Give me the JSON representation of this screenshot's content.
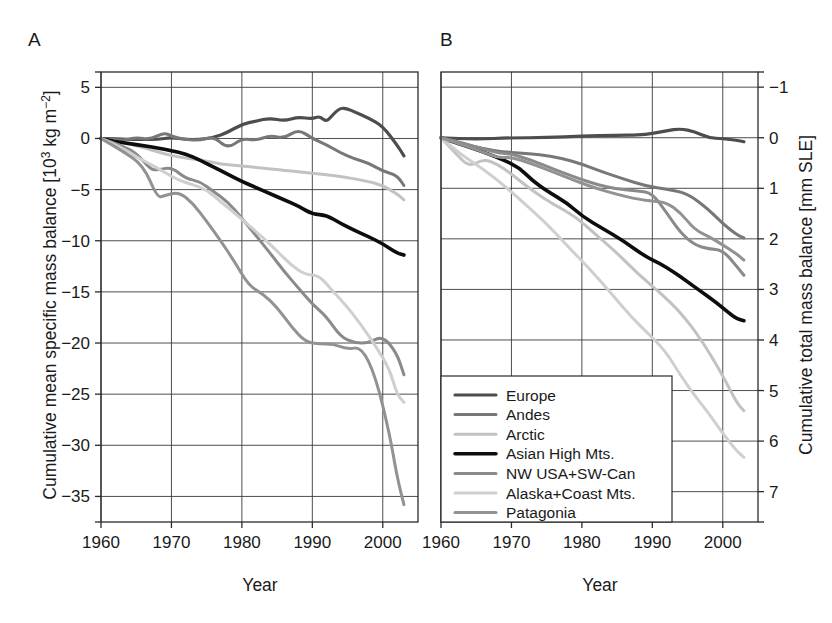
{
  "figure": {
    "panels": [
      {
        "label": "A",
        "xlabel": "Year",
        "ylabel": "Cumulative mean specific mass balance [10³ kg m⁻²]"
      },
      {
        "label": "B",
        "xlabel": "Year",
        "ylabel": "Cumulative total mass balance [mm SLE]"
      }
    ]
  },
  "legend": {
    "entries": [
      {
        "label": "Europe",
        "color": "#4d4d4d"
      },
      {
        "label": "Andes",
        "color": "#777777"
      },
      {
        "label": "Arctic",
        "color": "#c2c2c2"
      },
      {
        "label": "Asian High Mts.",
        "color": "#0d0d0d"
      },
      {
        "label": "NW USA+SW-Can",
        "color": "#8a8a8a"
      },
      {
        "label": "Alaska+Coast Mts.",
        "color": "#cfcfcf"
      },
      {
        "label": "Patagonia",
        "color": "#929292"
      }
    ]
  },
  "chart_data": [
    {
      "type": "line",
      "panel": "A",
      "title": "",
      "xlabel": "Year",
      "ylabel": "Cumulative mean specific mass balance [10³ kg m⁻²]",
      "xlim": [
        1960,
        2005
      ],
      "ylim": [
        -37.5,
        6.5
      ],
      "xticks": [
        1960,
        1970,
        1980,
        1990,
        2000
      ],
      "xticklabels": [
        "1960",
        "1970",
        "1980",
        "1990",
        "2000"
      ],
      "yticks": [
        5,
        0,
        -5,
        -10,
        -15,
        -20,
        -25,
        -30,
        -35
      ],
      "yticklabels": [
        "5",
        "0",
        "−5",
        "−10",
        "−15",
        "−20",
        "−25",
        "−30",
        "−35"
      ],
      "grid": true,
      "legend_position": "outside-bottom-center",
      "series": [
        {
          "name": "Europe",
          "color": "#4d4d4d",
          "x": [
            1960,
            1962,
            1964,
            1966,
            1968,
            1970,
            1972,
            1974,
            1976,
            1978,
            1980,
            1982,
            1984,
            1986,
            1988,
            1990,
            1991,
            1992,
            1993,
            1994,
            1995,
            1996,
            1998,
            2000,
            2002,
            2003
          ],
          "values": [
            0,
            0,
            -0.1,
            -0.1,
            -0.1,
            0.1,
            -0.1,
            -0.1,
            0.1,
            0.6,
            1.4,
            1.7,
            2.0,
            1.7,
            2.1,
            1.9,
            2.2,
            1.6,
            2.4,
            3.0,
            2.9,
            2.6,
            2.0,
            1.2,
            -0.6,
            -1.7
          ]
        },
        {
          "name": "Andes",
          "color": "#777777",
          "x": [
            1960,
            1963,
            1965,
            1967,
            1969,
            1970,
            1972,
            1974,
            1976,
            1978,
            1980,
            1982,
            1984,
            1986,
            1988,
            1990,
            1992,
            1994,
            1996,
            1998,
            2000,
            2002,
            2003
          ],
          "values": [
            0,
            -0.2,
            0.1,
            -0.1,
            0.6,
            0.2,
            -0.1,
            -0.2,
            0.2,
            -1.0,
            0.0,
            -0.2,
            0.3,
            0.0,
            0.9,
            0.0,
            -0.6,
            -1.4,
            -2.0,
            -2.4,
            -3.2,
            -3.6,
            -4.6
          ]
        },
        {
          "name": "Arctic",
          "color": "#c2c2c2",
          "x": [
            1960,
            1963,
            1965,
            1967,
            1969,
            1971,
            1973,
            1975,
            1977,
            1980,
            1983,
            1986,
            1990,
            1994,
            1998,
            2000,
            2002,
            2003
          ],
          "values": [
            0,
            -0.4,
            -0.7,
            -1.1,
            -1.5,
            -1.8,
            -2.0,
            -2.2,
            -2.5,
            -2.7,
            -2.9,
            -3.1,
            -3.4,
            -3.7,
            -4.2,
            -4.6,
            -5.4,
            -6.0
          ]
        },
        {
          "name": "Asian High Mts.",
          "color": "#0d0d0d",
          "x": [
            1960,
            1962,
            1964,
            1966,
            1968,
            1970,
            1972,
            1974,
            1976,
            1978,
            1980,
            1982,
            1984,
            1986,
            1988,
            1990,
            1992,
            1994,
            1996,
            1998,
            2000,
            2002,
            2003
          ],
          "values": [
            0,
            -0.3,
            -0.5,
            -0.7,
            -0.9,
            -1.2,
            -1.5,
            -2.1,
            -2.8,
            -3.5,
            -4.2,
            -4.8,
            -5.4,
            -6.0,
            -6.6,
            -7.4,
            -7.5,
            -8.3,
            -9.0,
            -9.6,
            -10.3,
            -11.2,
            -11.4
          ]
        },
        {
          "name": "NW USA+SW-Can",
          "color": "#8a8a8a",
          "x": [
            1960,
            1963,
            1965,
            1967,
            1968,
            1970,
            1972,
            1974,
            1976,
            1978,
            1980,
            1982,
            1984,
            1986,
            1988,
            1990,
            1992,
            1994,
            1996,
            1998,
            2000,
            2002,
            2003
          ],
          "values": [
            0,
            -0.7,
            -1.4,
            -3.0,
            -3.1,
            -2.8,
            -3.9,
            -4.2,
            -5.2,
            -6.2,
            -7.8,
            -9.5,
            -11.2,
            -13.0,
            -14.6,
            -16.2,
            -17.4,
            -19.4,
            -20.0,
            -20.0,
            -19.3,
            -21.0,
            -23.1
          ]
        },
        {
          "name": "Alaska+Coast Mts.",
          "color": "#cfcfcf",
          "x": [
            1960,
            1963,
            1965,
            1967,
            1969,
            1971,
            1973,
            1975,
            1977,
            1979,
            1981,
            1983,
            1985,
            1987,
            1989,
            1991,
            1993,
            1995,
            1997,
            1999,
            2001,
            2002,
            2003
          ],
          "values": [
            0,
            -0.9,
            -1.8,
            -2.5,
            -3.3,
            -4.1,
            -4.5,
            -5.0,
            -6.2,
            -7.3,
            -8.5,
            -9.7,
            -11.0,
            -12.4,
            -13.3,
            -13.4,
            -15.0,
            -16.5,
            -18.3,
            -20.3,
            -22.6,
            -25.0,
            -25.8
          ]
        },
        {
          "name": "Patagonia",
          "color": "#929292",
          "x": [
            1960,
            1963,
            1966,
            1968,
            1969,
            1971,
            1973,
            1975,
            1977,
            1979,
            1981,
            1983,
            1985,
            1987,
            1989,
            1991,
            1993,
            1995,
            1997,
            1999,
            2001,
            2002,
            2003
          ],
          "values": [
            0,
            -1.2,
            -2.6,
            -5.8,
            -5.6,
            -5.2,
            -6.3,
            -8.1,
            -10.0,
            -12.1,
            -14.4,
            -15.2,
            -16.5,
            -18.4,
            -19.9,
            -20.1,
            -20.1,
            -20.6,
            -20.4,
            -23.3,
            -29.0,
            -33.0,
            -35.8
          ]
        }
      ]
    },
    {
      "type": "line",
      "panel": "B",
      "title": "",
      "xlabel": "Year",
      "ylabel": "Cumulative total mass balance [mm SLE]",
      "xlim": [
        1960,
        2005
      ],
      "ylim": [
        -1.3,
        7.6
      ],
      "xticks": [
        1960,
        1970,
        1980,
        1990,
        2000
      ],
      "xticklabels": [
        "1960",
        "1970",
        "1980",
        "1990",
        "2000"
      ],
      "yticks": [
        -1,
        0,
        1,
        2,
        3,
        4,
        5,
        6,
        7
      ],
      "yticklabels": [
        "−1",
        "0",
        "1",
        "2",
        "3",
        "4",
        "5",
        "6",
        "7"
      ],
      "y_axis_inverted": true,
      "grid": true,
      "legend_position": "inside-bottom-left",
      "series": [
        {
          "name": "Europe",
          "color": "#4d4d4d",
          "x": [
            1960,
            1965,
            1970,
            1975,
            1980,
            1985,
            1988,
            1990,
            1992,
            1994,
            1996,
            1998,
            2000,
            2002,
            2003
          ],
          "values": [
            0,
            0.03,
            0.0,
            0.0,
            -0.03,
            -0.05,
            -0.05,
            -0.08,
            -0.14,
            -0.18,
            -0.12,
            0.0,
            0.02,
            0.05,
            0.08
          ]
        },
        {
          "name": "Andes",
          "color": "#777777",
          "x": [
            1960,
            1963,
            1966,
            1969,
            1971,
            1974,
            1977,
            1980,
            1983,
            1986,
            1989,
            1992,
            1995,
            1998,
            2000,
            2002,
            2003
          ],
          "values": [
            0,
            0.12,
            0.22,
            0.28,
            0.3,
            0.33,
            0.4,
            0.52,
            0.68,
            0.82,
            0.95,
            1.02,
            1.1,
            1.42,
            1.7,
            1.92,
            1.98
          ]
        },
        {
          "name": "Arctic",
          "color": "#c2c2c2",
          "x": [
            1960,
            1962,
            1964,
            1966,
            1968,
            1970,
            1973,
            1976,
            1979,
            1982,
            1985,
            1988,
            1991,
            1994,
            1997,
            2000,
            2002,
            2003
          ],
          "values": [
            0,
            0.3,
            0.58,
            0.42,
            0.52,
            0.72,
            1.05,
            1.32,
            1.55,
            1.92,
            2.28,
            2.7,
            3.05,
            3.45,
            4.0,
            4.7,
            5.25,
            5.4
          ]
        },
        {
          "name": "Asian High Mts.",
          "color": "#0d0d0d",
          "x": [
            1960,
            1963,
            1966,
            1969,
            1971,
            1973,
            1975,
            1978,
            1980,
            1983,
            1986,
            1989,
            1991,
            1993,
            1995,
            1997,
            1999,
            2001,
            2002,
            2003
          ],
          "values": [
            0,
            0.14,
            0.28,
            0.45,
            0.58,
            0.85,
            1.05,
            1.3,
            1.55,
            1.8,
            2.05,
            2.35,
            2.48,
            2.65,
            2.85,
            3.05,
            3.25,
            3.48,
            3.58,
            3.62
          ]
        },
        {
          "name": "NW USA+SW-Can",
          "color": "#8a8a8a",
          "x": [
            1960,
            1963,
            1966,
            1968,
            1970,
            1973,
            1976,
            1979,
            1982,
            1985,
            1988,
            1990,
            1992,
            1994,
            1996,
            1998,
            2000,
            2002,
            2003
          ],
          "values": [
            0,
            0.1,
            0.22,
            0.3,
            0.32,
            0.45,
            0.62,
            0.78,
            0.92,
            1.02,
            1.05,
            1.1,
            1.48,
            1.88,
            2.12,
            2.2,
            2.22,
            2.55,
            2.72
          ]
        },
        {
          "name": "Alaska+Coast Mts.",
          "color": "#cfcfcf",
          "x": [
            1960,
            1963,
            1966,
            1969,
            1972,
            1975,
            1978,
            1981,
            1984,
            1987,
            1990,
            1992,
            1994,
            1996,
            1998,
            2000,
            2002,
            2003
          ],
          "values": [
            0,
            0.35,
            0.62,
            0.95,
            1.32,
            1.7,
            2.15,
            2.58,
            3.05,
            3.55,
            3.95,
            4.25,
            4.7,
            5.1,
            5.45,
            5.85,
            6.2,
            6.32
          ]
        },
        {
          "name": "Patagonia",
          "color": "#929292",
          "x": [
            1960,
            1963,
            1966,
            1968,
            1970,
            1973,
            1976,
            1979,
            1982,
            1985,
            1988,
            1990,
            1992,
            1994,
            1996,
            1998,
            2000,
            2002,
            2003
          ],
          "values": [
            0,
            0.14,
            0.28,
            0.4,
            0.38,
            0.52,
            0.68,
            0.85,
            1.0,
            1.12,
            1.22,
            1.25,
            1.28,
            1.48,
            1.82,
            1.95,
            2.12,
            2.3,
            2.42
          ]
        }
      ]
    }
  ]
}
